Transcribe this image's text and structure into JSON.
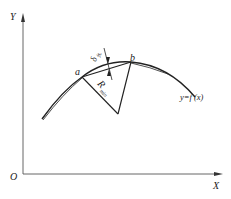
{
  "diagram": {
    "axes": {
      "origin_label": "O",
      "x_label": "X",
      "y_label": "Y"
    },
    "points": {
      "a_label": "a",
      "b_label": "b"
    },
    "annotations": {
      "delta_symbol": "δ",
      "delta_subscript": "允",
      "radius_symbol": "R",
      "radius_subscript": "min",
      "curve_label": "y=f (x)"
    },
    "colors": {
      "line": "#222222",
      "axis": "#555555",
      "background": "#ffffff"
    }
  }
}
